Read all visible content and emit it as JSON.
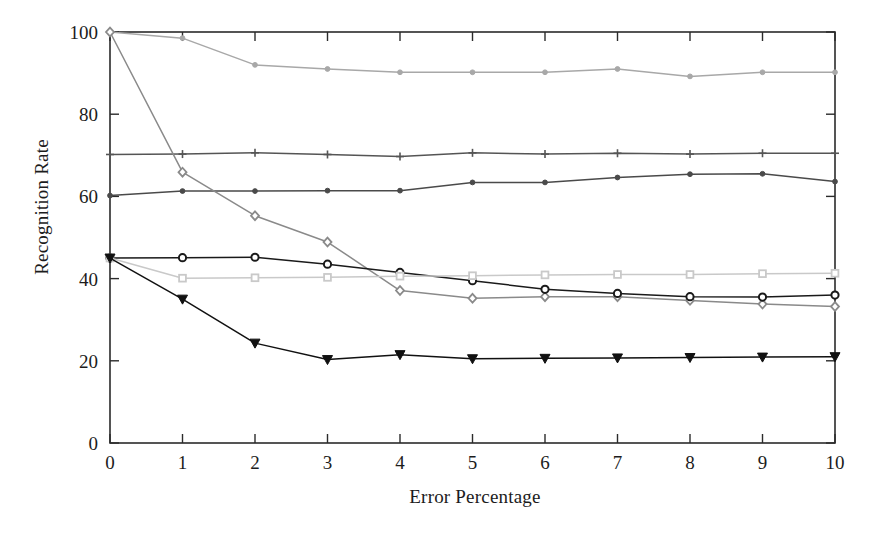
{
  "figure": {
    "background_color": "#ffffff",
    "type": "line-chart"
  },
  "axes": {
    "xlabel": "Error Percentage",
    "ylabel": "Recognition Rate",
    "x_ticks": [
      "0",
      "1",
      "2",
      "3",
      "4",
      "5",
      "6",
      "7",
      "8",
      "9",
      "10"
    ],
    "y_ticks": [
      "0",
      "20",
      "40",
      "60",
      "80",
      "100"
    ],
    "x_range": [
      0,
      10
    ],
    "y_range": [
      0,
      100
    ],
    "frame_color": "#2b2b2b"
  },
  "chart_data": {
    "type": "line",
    "title": "",
    "xlabel": "Error Percentage",
    "ylabel": "Recognition Rate",
    "xlim": [
      0,
      10
    ],
    "ylim": [
      0,
      100
    ],
    "xticks": [
      0,
      1,
      2,
      3,
      4,
      5,
      6,
      7,
      8,
      9,
      10
    ],
    "yticks": [
      0,
      20,
      40,
      60,
      80,
      100
    ],
    "grid": false,
    "legend": "none",
    "x": [
      0,
      1,
      2,
      3,
      4,
      5,
      6,
      7,
      8,
      9,
      10
    ],
    "series": [
      {
        "name": "series-top-light",
        "marker": "dot",
        "color": "#a8a8a8",
        "values": [
          100,
          98.5,
          92.0,
          91.0,
          90.2,
          90.2,
          90.2,
          91.0,
          89.2,
          90.2,
          90.2
        ]
      },
      {
        "name": "series-plus-flat",
        "marker": "plus",
        "color": "#555555",
        "values": [
          70.2,
          70.3,
          70.6,
          70.2,
          69.7,
          70.6,
          70.3,
          70.5,
          70.3,
          70.5,
          70.5
        ]
      },
      {
        "name": "series-dot-rising",
        "marker": "dot",
        "color": "#4a4a4a",
        "values": [
          60.2,
          61.3,
          61.3,
          61.4,
          61.4,
          63.4,
          63.4,
          64.6,
          65.4,
          65.5,
          63.6
        ]
      },
      {
        "name": "series-steep-diamond",
        "marker": "diamond",
        "color": "#8a8a8a",
        "values": [
          100,
          65.9,
          55.3,
          48.9,
          37.1,
          35.2,
          35.6,
          35.6,
          34.7,
          33.8,
          33.2
        ]
      },
      {
        "name": "series-dark-circle",
        "marker": "circle",
        "color": "#1a1a1a",
        "values": [
          45.0,
          45.1,
          45.2,
          43.5,
          41.5,
          39.5,
          37.4,
          36.4,
          35.6,
          35.5,
          36.0
        ]
      },
      {
        "name": "series-light-square",
        "marker": "square",
        "color": "#c9c9c9",
        "values": [
          45.0,
          40.1,
          40.2,
          40.3,
          40.6,
          40.7,
          40.9,
          41.0,
          41.0,
          41.2,
          41.3
        ]
      },
      {
        "name": "series-triangle-low",
        "marker": "triangle-down",
        "color": "#111111",
        "values": [
          45.0,
          35.0,
          24.3,
          20.3,
          21.5,
          20.5,
          20.6,
          20.7,
          20.8,
          20.9,
          21.0
        ]
      }
    ]
  }
}
